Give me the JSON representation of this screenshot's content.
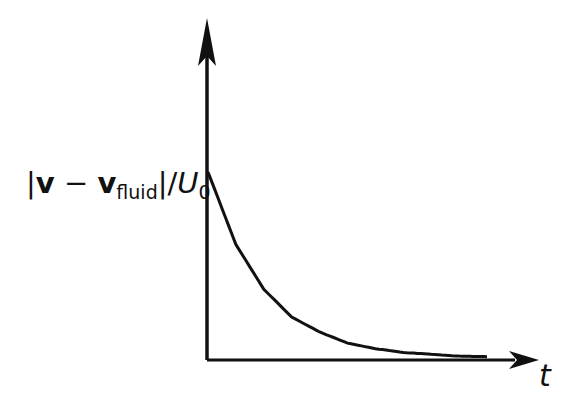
{
  "chart_data": {
    "type": "line",
    "title": "",
    "xlabel": "t",
    "ylabel": "|v − v_fluid| / U_0",
    "ylabel_parts": {
      "bar_open": "|",
      "v": "v",
      "minus": " − ",
      "v2": "v",
      "sub": "fluid",
      "bar_close": "|/",
      "U": "U",
      "u_sub": "0"
    },
    "grid": false,
    "legend": null,
    "x_ticks": [],
    "y_ticks": [],
    "series": [
      {
        "name": "relative speed",
        "x": [
          0,
          0.5,
          1,
          1.5,
          2,
          2.5,
          3,
          3.5,
          4,
          4.5,
          5
        ],
        "values": [
          1.0,
          0.61,
          0.37,
          0.22,
          0.14,
          0.08,
          0.05,
          0.03,
          0.02,
          0.01,
          0.007
        ]
      }
    ],
    "colors": {
      "line": "#111111",
      "axes": "#111111",
      "background": "#ffffff"
    }
  }
}
